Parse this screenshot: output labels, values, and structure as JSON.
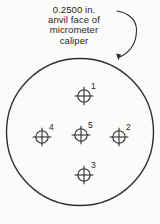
{
  "figure": {
    "caption_lines": [
      "0.2500 in.",
      "anvil face of",
      "micrometer",
      "caliper"
    ],
    "anvil_circle": {
      "cx": 80,
      "cy": 132,
      "r": 73.5
    },
    "points": [
      {
        "label": "1",
        "x": 84,
        "y": 96
      },
      {
        "label": "2",
        "x": 119,
        "y": 137
      },
      {
        "label": "3",
        "x": 84,
        "y": 175
      },
      {
        "label": "4",
        "x": 42,
        "y": 137
      },
      {
        "label": "5",
        "x": 81,
        "y": 135
      }
    ],
    "colors": {
      "ink": "#2e2e2e",
      "background": "#fbfbf9"
    },
    "symbol": {
      "circle_radius": 6.2,
      "cross_half_length": 9.3
    }
  }
}
